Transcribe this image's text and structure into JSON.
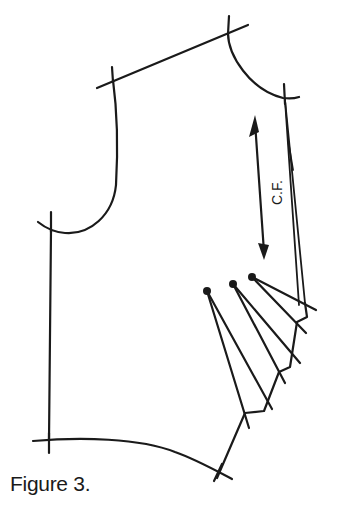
{
  "figure": {
    "caption": "Figure 3.",
    "center_front_label": "C.F.",
    "line_color": "#1a1a1a",
    "background": "#ffffff",
    "dart_count": 3
  }
}
